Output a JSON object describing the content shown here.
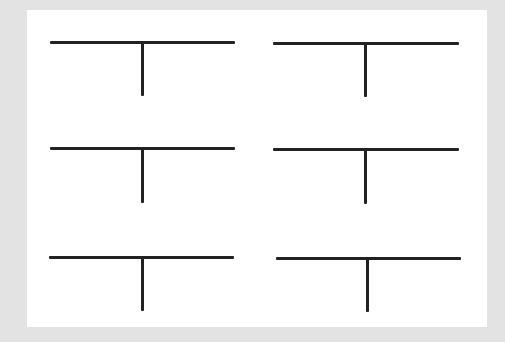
{
  "canvas": {
    "width": 505,
    "height": 342,
    "background_color": "#e3e3e3"
  },
  "panel": {
    "x": 27,
    "y": 10,
    "width": 460,
    "height": 317,
    "color": "#ffffff"
  },
  "stroke": {
    "color": "#222222",
    "width": 3
  },
  "shapes": [
    {
      "id": "tee-1",
      "row": 1,
      "col": 1,
      "bar_x1": 50,
      "bar_x2": 235,
      "bar_y": 42,
      "stem_x": 142,
      "stem_bottom": 96
    },
    {
      "id": "tee-2",
      "row": 1,
      "col": 2,
      "bar_x1": 273,
      "bar_x2": 459,
      "bar_y": 43,
      "stem_x": 365,
      "stem_bottom": 97
    },
    {
      "id": "tee-3",
      "row": 2,
      "col": 1,
      "bar_x1": 50,
      "bar_x2": 235,
      "bar_y": 148,
      "stem_x": 142,
      "stem_bottom": 203
    },
    {
      "id": "tee-4",
      "row": 2,
      "col": 2,
      "bar_x1": 273,
      "bar_x2": 459,
      "bar_y": 149,
      "stem_x": 365,
      "stem_bottom": 204
    },
    {
      "id": "tee-5",
      "row": 3,
      "col": 1,
      "bar_x1": 49,
      "bar_x2": 234,
      "bar_y": 257,
      "stem_x": 142,
      "stem_bottom": 311
    },
    {
      "id": "tee-6",
      "row": 3,
      "col": 2,
      "bar_x1": 276,
      "bar_x2": 461,
      "bar_y": 258,
      "stem_x": 367,
      "stem_bottom": 312
    }
  ]
}
